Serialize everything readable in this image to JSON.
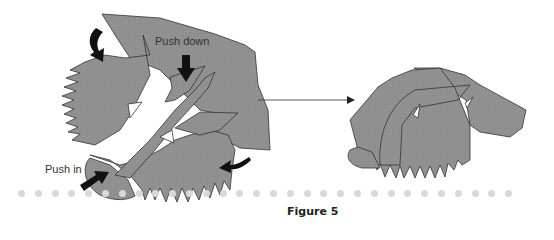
{
  "figure": {
    "caption": "Figure 5",
    "labels": {
      "push_down": "Push down",
      "push_in": "Push in"
    },
    "colors": {
      "paper": "#8f8f8f",
      "outline": "#333333",
      "arrow": "#111111",
      "dots": "#d9d9d9"
    },
    "dot_count": 30
  }
}
